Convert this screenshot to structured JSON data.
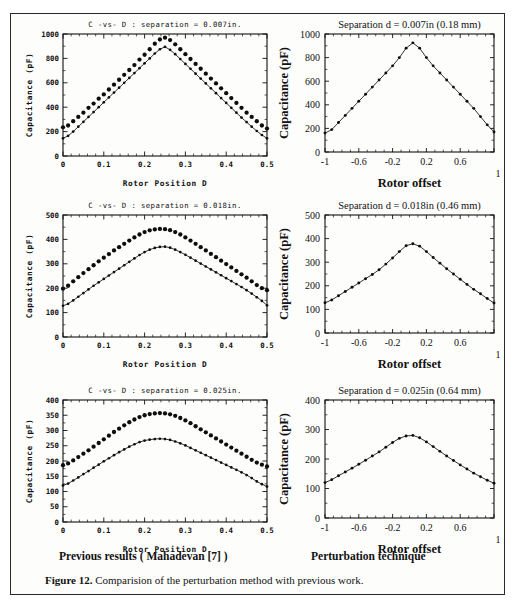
{
  "figure": {
    "caption_label": "Figure 12.",
    "caption_text": "Comparision of the perturbation method with previous work.",
    "column_header_left": "Previous results ( Mahadevan [7] )",
    "column_header_right": "Perturbation technique"
  },
  "chart_data": [
    {
      "id": "left-top",
      "type": "line",
      "title": "C -vs- D : separation = 0.007in.",
      "xlabel": "Rotor Position D",
      "ylabel": "Capacitance (pF)",
      "xlim": [
        0,
        0.5
      ],
      "ylim": [
        0,
        1000
      ],
      "xticks": [
        0,
        0.1,
        0.2,
        0.3,
        0.4,
        0.5
      ],
      "xticklabels": [
        "0",
        "0.1",
        "0.2",
        "0.3",
        "0.4",
        "0.5"
      ],
      "yticks": [
        0,
        200,
        400,
        600,
        800,
        1000
      ],
      "yticklabels": [
        "0",
        "200",
        "400",
        "600",
        "800",
        "1000"
      ],
      "grid": false,
      "legend": "none",
      "series": [
        {
          "name": "upper-dotted",
          "style": "markers",
          "x": [
            0,
            0.0125,
            0.025,
            0.0375,
            0.05,
            0.0625,
            0.075,
            0.0875,
            0.1,
            0.1125,
            0.125,
            0.1375,
            0.15,
            0.1625,
            0.175,
            0.1875,
            0.2,
            0.2125,
            0.225,
            0.2375,
            0.25,
            0.2625,
            0.275,
            0.2875,
            0.3,
            0.3125,
            0.325,
            0.3375,
            0.35,
            0.3625,
            0.375,
            0.3875,
            0.4,
            0.4125,
            0.425,
            0.4375,
            0.45,
            0.4625,
            0.475,
            0.4875,
            0.5
          ],
          "values": [
            235,
            250,
            285,
            320,
            355,
            395,
            430,
            470,
            505,
            545,
            585,
            625,
            665,
            705,
            745,
            790,
            830,
            875,
            920,
            955,
            970,
            950,
            915,
            875,
            835,
            795,
            755,
            715,
            675,
            635,
            595,
            555,
            515,
            475,
            435,
            395,
            355,
            320,
            285,
            250,
            225
          ]
        },
        {
          "name": "lower-line",
          "style": "line+markers",
          "x": [
            0,
            0.0125,
            0.025,
            0.0375,
            0.05,
            0.0625,
            0.075,
            0.0875,
            0.1,
            0.1125,
            0.125,
            0.1375,
            0.15,
            0.1625,
            0.175,
            0.1875,
            0.2,
            0.2125,
            0.225,
            0.2375,
            0.25,
            0.2625,
            0.275,
            0.2875,
            0.3,
            0.3125,
            0.325,
            0.3375,
            0.35,
            0.3625,
            0.375,
            0.3875,
            0.4,
            0.4125,
            0.425,
            0.4375,
            0.45,
            0.4625,
            0.475,
            0.4875,
            0.5
          ],
          "values": [
            145,
            165,
            200,
            240,
            280,
            320,
            360,
            400,
            440,
            480,
            520,
            560,
            600,
            640,
            680,
            720,
            760,
            800,
            840,
            875,
            895,
            870,
            835,
            795,
            755,
            715,
            675,
            635,
            595,
            555,
            515,
            475,
            435,
            395,
            355,
            315,
            278,
            240,
            205,
            172,
            145
          ]
        }
      ]
    },
    {
      "id": "right-top",
      "type": "line",
      "title": "Separation d = 0.007in  (0.18 mm)",
      "xlabel": "Rotor offset",
      "ylabel": "Capacitance (pF)",
      "xlim": [
        -1,
        1
      ],
      "ylim": [
        0,
        1000
      ],
      "xticks": [
        -1,
        -0.6,
        -0.2,
        0.2,
        0.6,
        1
      ],
      "xticklabels": [
        "-1",
        "-0.6",
        "-0.2",
        "0.2",
        "0.6",
        "1"
      ],
      "yticks": [
        0,
        200,
        400,
        600,
        800,
        1000
      ],
      "yticklabels": [
        "0",
        "200",
        "400",
        "600",
        "800",
        "1000"
      ],
      "grid": false,
      "legend": "none",
      "series": [
        {
          "name": "perturbation",
          "style": "line+markers",
          "x": [
            -1,
            -0.92,
            -0.84,
            -0.76,
            -0.68,
            -0.6,
            -0.52,
            -0.44,
            -0.36,
            -0.28,
            -0.2,
            -0.12,
            -0.04,
            0.04,
            0.12,
            0.2,
            0.28,
            0.36,
            0.44,
            0.52,
            0.6,
            0.68,
            0.76,
            0.84,
            0.92,
            1
          ],
          "values": [
            160,
            190,
            250,
            310,
            370,
            430,
            490,
            550,
            610,
            670,
            730,
            800,
            880,
            925,
            880,
            800,
            730,
            670,
            610,
            550,
            490,
            430,
            370,
            300,
            230,
            170
          ]
        }
      ]
    },
    {
      "id": "left-middle",
      "type": "line",
      "title": "C -vs- D : separation = 0.018in.",
      "xlabel": "Rotor Position D",
      "ylabel": "Capacitance (pF)",
      "xlim": [
        0,
        0.5
      ],
      "ylim": [
        0,
        500
      ],
      "xticks": [
        0,
        0.1,
        0.2,
        0.3,
        0.4,
        0.5
      ],
      "xticklabels": [
        "0",
        "0.1",
        "0.2",
        "0.3",
        "0.4",
        "0.5"
      ],
      "yticks": [
        0,
        100,
        200,
        300,
        400,
        500
      ],
      "yticklabels": [
        "0",
        "100",
        "200",
        "300",
        "400",
        "500"
      ],
      "grid": false,
      "legend": "none",
      "series": [
        {
          "name": "upper-dotted",
          "style": "markers",
          "x": [
            0,
            0.0125,
            0.025,
            0.0375,
            0.05,
            0.0625,
            0.075,
            0.0875,
            0.1,
            0.1125,
            0.125,
            0.1375,
            0.15,
            0.1625,
            0.175,
            0.1875,
            0.2,
            0.2125,
            0.225,
            0.2375,
            0.25,
            0.2625,
            0.275,
            0.2875,
            0.3,
            0.3125,
            0.325,
            0.3375,
            0.35,
            0.3625,
            0.375,
            0.3875,
            0.4,
            0.4125,
            0.425,
            0.4375,
            0.45,
            0.4625,
            0.475,
            0.4875,
            0.5
          ],
          "values": [
            198,
            210,
            228,
            245,
            262,
            278,
            294,
            310,
            325,
            340,
            355,
            368,
            382,
            395,
            408,
            420,
            430,
            437,
            441,
            443,
            442,
            438,
            430,
            420,
            408,
            395,
            382,
            368,
            355,
            341,
            327,
            313,
            299,
            285,
            271,
            257,
            243,
            228,
            213,
            200,
            192
          ]
        },
        {
          "name": "lower-line",
          "style": "line+markers",
          "x": [
            0,
            0.0125,
            0.025,
            0.0375,
            0.05,
            0.0625,
            0.075,
            0.0875,
            0.1,
            0.1125,
            0.125,
            0.1375,
            0.15,
            0.1625,
            0.175,
            0.1875,
            0.2,
            0.2125,
            0.225,
            0.2375,
            0.25,
            0.2625,
            0.275,
            0.2875,
            0.3,
            0.3125,
            0.325,
            0.3375,
            0.35,
            0.3625,
            0.375,
            0.3875,
            0.4,
            0.4125,
            0.425,
            0.4375,
            0.45,
            0.4625,
            0.475,
            0.4875,
            0.5
          ],
          "values": [
            128,
            136,
            150,
            165,
            180,
            195,
            210,
            224,
            238,
            252,
            266,
            280,
            294,
            308,
            322,
            336,
            348,
            358,
            365,
            369,
            370,
            366,
            358,
            348,
            337,
            325,
            313,
            301,
            289,
            277,
            265,
            253,
            241,
            229,
            217,
            205,
            192,
            178,
            163,
            148,
            130
          ]
        }
      ]
    },
    {
      "id": "right-middle",
      "type": "line",
      "title": "Separation d = 0.018in  (0.46 mm)",
      "xlabel": "Rotor offset",
      "ylabel": "Capacitance (pF)",
      "xlim": [
        -1,
        1
      ],
      "ylim": [
        0,
        500
      ],
      "xticks": [
        -1,
        -0.6,
        -0.2,
        0.2,
        0.6,
        1
      ],
      "xticklabels": [
        "-1",
        "-0.6",
        "-0.2",
        "0.2",
        "0.6",
        "1"
      ],
      "yticks": [
        0,
        100,
        200,
        300,
        400,
        500
      ],
      "yticklabels": [
        "0",
        "100",
        "200",
        "300",
        "400",
        "500"
      ],
      "grid": false,
      "legend": "none",
      "series": [
        {
          "name": "perturbation",
          "style": "line+markers",
          "x": [
            -1,
            -0.92,
            -0.84,
            -0.76,
            -0.68,
            -0.6,
            -0.52,
            -0.44,
            -0.36,
            -0.28,
            -0.2,
            -0.12,
            -0.04,
            0.04,
            0.12,
            0.2,
            0.28,
            0.36,
            0.44,
            0.52,
            0.6,
            0.68,
            0.76,
            0.84,
            0.92,
            1
          ],
          "values": [
            128,
            140,
            158,
            176,
            194,
            212,
            230,
            248,
            268,
            292,
            318,
            345,
            370,
            378,
            368,
            345,
            320,
            296,
            272,
            250,
            228,
            206,
            185,
            166,
            146,
            127
          ]
        }
      ]
    },
    {
      "id": "left-bottom",
      "type": "line",
      "title": "C -vs- D : separation = 0.025in.",
      "xlabel": "Rotor Position D",
      "ylabel": "Capacitance (pF)",
      "xlim": [
        0,
        0.5
      ],
      "ylim": [
        0,
        400
      ],
      "xticks": [
        0,
        0.1,
        0.2,
        0.3,
        0.4,
        0.5
      ],
      "xticklabels": [
        "0",
        "0.1",
        "0.2",
        "0.3",
        "0.4",
        "0.5"
      ],
      "yticks": [
        0,
        50,
        100,
        150,
        200,
        250,
        300,
        350,
        400
      ],
      "yticklabels": [
        "0",
        "50",
        "100",
        "150",
        "200",
        "250",
        "300",
        "350",
        "400"
      ],
      "grid": false,
      "legend": "none",
      "series": [
        {
          "name": "upper-dotted",
          "style": "markers",
          "x": [
            0,
            0.0125,
            0.025,
            0.0375,
            0.05,
            0.0625,
            0.075,
            0.0875,
            0.1,
            0.1125,
            0.125,
            0.1375,
            0.15,
            0.1625,
            0.175,
            0.1875,
            0.2,
            0.2125,
            0.225,
            0.2375,
            0.25,
            0.2625,
            0.275,
            0.2875,
            0.3,
            0.3125,
            0.325,
            0.3375,
            0.35,
            0.3625,
            0.375,
            0.3875,
            0.4,
            0.4125,
            0.425,
            0.4375,
            0.45,
            0.4625,
            0.475,
            0.4875,
            0.5
          ],
          "values": [
            186,
            192,
            202,
            213,
            224,
            235,
            247,
            259,
            271,
            283,
            295,
            306,
            317,
            327,
            336,
            344,
            350,
            354,
            356,
            357,
            356,
            353,
            348,
            341,
            333,
            324,
            314,
            304,
            294,
            284,
            274,
            264,
            254,
            244,
            234,
            224,
            214,
            204,
            195,
            188,
            182
          ]
        },
        {
          "name": "lower-line",
          "style": "line+markers",
          "x": [
            0,
            0.0125,
            0.025,
            0.0375,
            0.05,
            0.0625,
            0.075,
            0.0875,
            0.1,
            0.1125,
            0.125,
            0.1375,
            0.15,
            0.1625,
            0.175,
            0.1875,
            0.2,
            0.2125,
            0.225,
            0.2375,
            0.25,
            0.2625,
            0.275,
            0.2875,
            0.3,
            0.3125,
            0.325,
            0.3375,
            0.35,
            0.3625,
            0.375,
            0.3875,
            0.4,
            0.4125,
            0.425,
            0.4375,
            0.45,
            0.4625,
            0.475,
            0.4875,
            0.5
          ],
          "values": [
            120,
            126,
            136,
            146,
            157,
            167,
            178,
            188,
            199,
            209,
            219,
            229,
            238,
            247,
            255,
            262,
            267,
            270,
            272,
            273,
            272,
            269,
            264,
            258,
            251,
            243,
            235,
            227,
            219,
            211,
            203,
            195,
            187,
            179,
            171,
            163,
            154,
            144,
            133,
            124,
            116
          ]
        }
      ]
    },
    {
      "id": "right-bottom",
      "type": "line",
      "title": "Separation d = 0.025in  (0.64 mm)",
      "xlabel": "Rotor offset",
      "ylabel": "Capacitance (pF)",
      "xlim": [
        -1,
        1
      ],
      "ylim": [
        0,
        400
      ],
      "xticks": [
        -1,
        -0.6,
        -0.2,
        0.2,
        0.6,
        1
      ],
      "xticklabels": [
        "-1",
        "-0.6",
        "-0.2",
        "0.2",
        "0.6",
        "1"
      ],
      "yticks": [
        0,
        100,
        200,
        300,
        400
      ],
      "yticklabels": [
        "0",
        "100",
        "200",
        "300",
        "400"
      ],
      "grid": false,
      "legend": "none",
      "series": [
        {
          "name": "perturbation",
          "style": "line+markers",
          "x": [
            -1,
            -0.92,
            -0.84,
            -0.76,
            -0.68,
            -0.6,
            -0.52,
            -0.44,
            -0.36,
            -0.28,
            -0.2,
            -0.12,
            -0.04,
            0.04,
            0.12,
            0.2,
            0.28,
            0.36,
            0.44,
            0.52,
            0.6,
            0.68,
            0.76,
            0.84,
            0.92,
            1
          ],
          "values": [
            120,
            130,
            143,
            156,
            169,
            182,
            196,
            210,
            224,
            240,
            256,
            270,
            278,
            280,
            272,
            258,
            242,
            226,
            210,
            195,
            180,
            166,
            152,
            140,
            128,
            118
          ]
        }
      ]
    }
  ]
}
